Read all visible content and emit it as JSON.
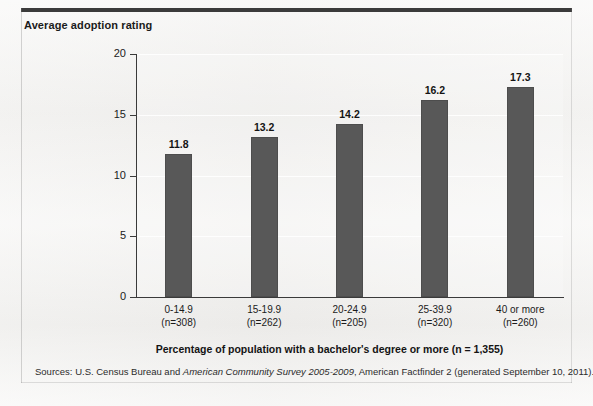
{
  "figure": {
    "y_axis_title": "Average adoption rating",
    "x_axis_title": "Percentage of population with a bachelor's degree or more (n = 1,355)",
    "sources": {
      "prefix": "Sources: U.S. Census Bureau and ",
      "italic": "American Community Survey 2005-2009",
      "suffix": ", American Factfinder 2 (generated September 10, 2011)."
    },
    "colors": {
      "bar_fill": "#585858",
      "bar_stroke": "#4d4d4d",
      "axis": "#3a3a3a",
      "text": "#1b1b1b",
      "background": "#f0efed",
      "top_rule": "#3b3b3b"
    }
  },
  "chart_data": {
    "type": "bar",
    "title": "",
    "subtitle": "",
    "xlabel": "Percentage of population with a bachelor's degree or more (n = 1,355)",
    "ylabel": "Average adoption rating",
    "categories": [
      "0-14.9",
      "15-19.9",
      "20-24.9",
      "25-39.9",
      "40 or more"
    ],
    "category_counts": [
      "(n=308)",
      "(n=262)",
      "(n=205)",
      "(n=320)",
      "(n=260)"
    ],
    "n_values": [
      308,
      262,
      205,
      320,
      260
    ],
    "values": [
      11.8,
      13.2,
      14.2,
      16.2,
      17.3
    ],
    "value_labels": [
      "11.8",
      "13.2",
      "14.2",
      "16.2",
      "17.3"
    ],
    "ylim": [
      0,
      20
    ],
    "yticks": [
      0,
      5,
      10,
      15,
      20
    ],
    "ytick_labels": [
      "0",
      "5",
      "10",
      "15",
      "20"
    ],
    "grid": true,
    "legend": null,
    "total_n": 1355
  }
}
